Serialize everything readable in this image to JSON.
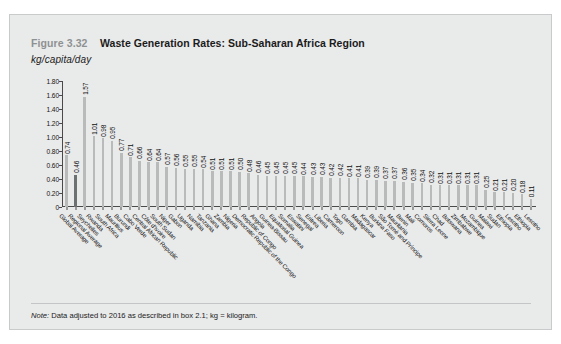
{
  "figure": {
    "number": "Figure 3.32",
    "title": "Waste Generation Rates: Sub-Saharan Africa Region",
    "unit": "kg/capita/day",
    "note_label": "Note:",
    "note_text": " Data adjusted to 2016 as described in box 2.1; kg = kilogram.",
    "highlight_color": "#6e7172",
    "bar_color": "#b9bbbb",
    "panel_color": "#e9eaea"
  },
  "chart_data": {
    "type": "bar",
    "title": "Waste Generation Rates: Sub-Saharan Africa Region",
    "xlabel": "",
    "ylabel": "kg/capita/day",
    "ylim": [
      0,
      1.8
    ],
    "yticks": [
      "0",
      "0.20",
      "0.40",
      "0.60",
      "0.80",
      "1.00",
      "1.20",
      "1.40",
      "1.60",
      "1.80"
    ],
    "ytick_values": [
      0,
      0.2,
      0.4,
      0.6,
      0.8,
      1.0,
      1.2,
      1.4,
      1.6,
      1.8
    ],
    "grid": false,
    "legend": "none",
    "highlight_index": 1,
    "categories": [
      "Global Average",
      "Regional Average",
      "Seychelles",
      "Rwanda",
      "South Africa",
      "Mauritius",
      "Burundi",
      "Cabo Verde",
      "Central African Republic",
      "Côte d'Ivoire",
      "South Sudan",
      "Niger",
      "Gabon",
      "Uganda",
      "Namibia",
      "Tanzania",
      "Ghana",
      "Zambia",
      "Nigeria",
      "Democratic Republic of the Congo",
      "Republic of Congo",
      "Angola",
      "Guinea-Bissau",
      "Equatorial Guinea",
      "Somalia",
      "Eswatini",
      "Senegal",
      "Eritrea",
      "Liberia",
      "Cameroon",
      "Togo",
      "Gambia",
      "Madagascar",
      "Kenya",
      "Burkina Faso",
      "São Tomé and Príncipe",
      "Mauritania",
      "Benin",
      "Mali",
      "Comoros",
      "Sierra Leone",
      "Chad",
      "Botswana",
      "Zimbabwe",
      "Mozambique",
      "Guinea",
      "Malawi",
      "Sudan",
      "Ethiopia",
      "Lesotho"
    ],
    "values": [
      0.74,
      0.46,
      1.57,
      1.01,
      0.98,
      0.95,
      0.77,
      0.71,
      0.66,
      0.64,
      0.64,
      0.57,
      0.56,
      0.55,
      0.55,
      0.54,
      0.51,
      0.51,
      0.51,
      0.5,
      0.48,
      0.46,
      0.45,
      0.45,
      0.45,
      0.45,
      0.44,
      0.43,
      0.43,
      0.42,
      0.42,
      0.41,
      0.41,
      0.39,
      0.39,
      0.37,
      0.37,
      0.36,
      0.35,
      0.34,
      0.32,
      0.31,
      0.31,
      0.31,
      0.31,
      0.31,
      0.25,
      0.21,
      0.21,
      0.2
    ],
    "value_labels": [
      "0.74",
      "0.46",
      "1.57",
      "1.01",
      "0.98",
      "0.95",
      "0.77",
      "0.71",
      "0.66",
      "0.64",
      "0.64",
      "0.57",
      "0.56",
      "0.55",
      "0.55",
      "0.54",
      "0.51",
      "0.51",
      "0.51",
      "0.50",
      "0.48",
      "0.46",
      "0.45",
      "0.45",
      "0.45",
      "0.45",
      "0.44",
      "0.43",
      "0.43",
      "0.42",
      "0.42",
      "0.41",
      "0.41",
      "0.39",
      "0.39",
      "0.37",
      "0.37",
      "0.36",
      "0.35",
      "0.34",
      "0.32",
      "0.31",
      "0.31",
      "0.31",
      "0.31",
      "0.31",
      "0.25",
      "0.21",
      "0.21",
      "0.20"
    ],
    "extra_values": [
      0.18,
      0.11
    ],
    "extra_value_labels": [
      "0.18",
      "0.11"
    ],
    "extra_categories": [
      "Ethiopia",
      "Lesotho"
    ]
  }
}
